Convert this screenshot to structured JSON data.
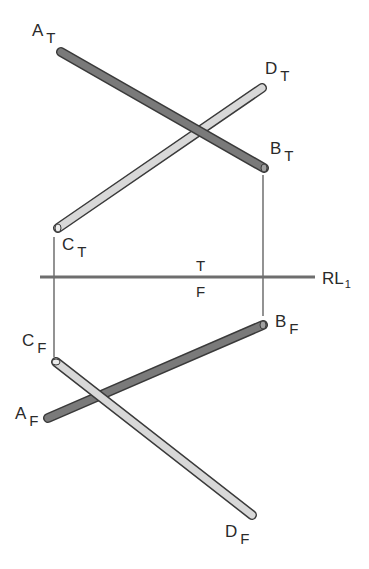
{
  "diagram": {
    "type": "orthographic projection (top and front views)",
    "reference_line": {
      "label": "RL",
      "subscript": "1",
      "above_label": "T",
      "below_label": "F"
    },
    "top_view": {
      "lines": [
        {
          "name": "AB",
          "start_label": "A",
          "end_label": "B",
          "view": "T",
          "shade": "dark"
        },
        {
          "name": "CD",
          "start_label": "C",
          "end_label": "D",
          "view": "T",
          "shade": "light"
        }
      ]
    },
    "front_view": {
      "lines": [
        {
          "name": "AB",
          "start_label": "A",
          "end_label": "B",
          "view": "F",
          "shade": "dark"
        },
        {
          "name": "CD",
          "start_label": "C",
          "end_label": "D",
          "view": "F",
          "shade": "light"
        }
      ]
    },
    "labels": {
      "a_t": {
        "main": "A",
        "sub": "T"
      },
      "b_t": {
        "main": "B",
        "sub": "T"
      },
      "c_t": {
        "main": "C",
        "sub": "T"
      },
      "d_t": {
        "main": "D",
        "sub": "T"
      },
      "a_f": {
        "main": "A",
        "sub": "F"
      },
      "b_f": {
        "main": "B",
        "sub": "F"
      },
      "c_f": {
        "main": "C",
        "sub": "F"
      },
      "d_f": {
        "main": "D",
        "sub": "F"
      }
    },
    "colors": {
      "dark_rod": "#7a7a7a",
      "light_rod": "#d8d8d8",
      "outline": "#3a3a3a",
      "reference_line": "#6e6e6e",
      "projector": "#4a4a4a"
    }
  }
}
